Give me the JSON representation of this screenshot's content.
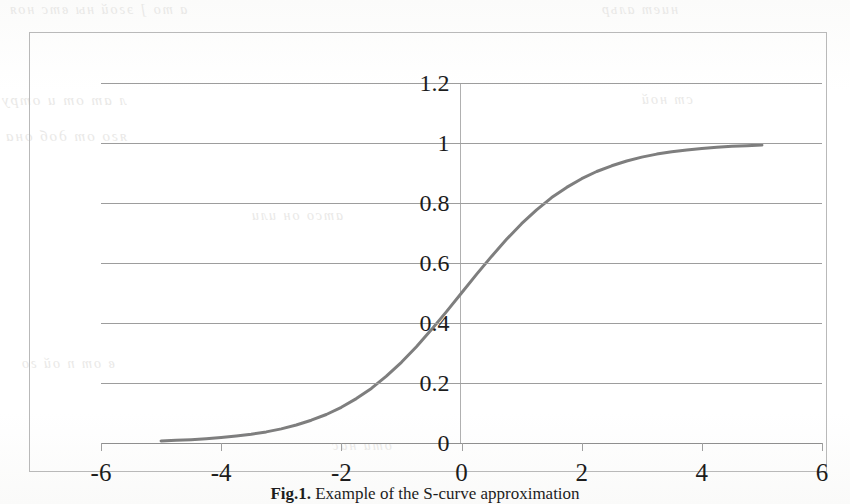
{
  "page": {
    "background_color": "#fdfdfc",
    "bleed_through_text": [
      "а то  ]   эгой ны  втс  ноя",
      "л ат от и  отру",
      "яго от  доб  она",
      "атсо  он  или",
      "в от п ой  го",
      "оти  нас",
      "ниет  альр",
      "ст ной"
    ]
  },
  "figure": {
    "caption_prefix": "Fig.1.",
    "caption_text": "Example of the S-curve approximation",
    "frame_border_color": "#b9b9b9"
  },
  "chart_data": {
    "type": "line",
    "title": "",
    "xlabel": "",
    "ylabel": "",
    "xlim": [
      -6,
      6
    ],
    "ylim": [
      0,
      1.2
    ],
    "grid": true,
    "legend": "none",
    "x_ticks": [
      -6,
      -4,
      -2,
      0,
      2,
      4,
      6
    ],
    "x_tick_labels": [
      "-6",
      "-4",
      "-2",
      "0",
      "2",
      "4",
      "6"
    ],
    "y_ticks": [
      0,
      0.2,
      0.4,
      0.6,
      0.8,
      1,
      1.2
    ],
    "y_tick_labels": [
      "0",
      "0.2",
      "0.4",
      "0.6",
      "0.8",
      "1",
      "1.2"
    ],
    "series": [
      {
        "name": "S-curve (logistic)",
        "color": "#7e7e7e",
        "line_width": 3,
        "x": [
          -5,
          -4.75,
          -4.5,
          -4.25,
          -4,
          -3.75,
          -3.5,
          -3.25,
          -3,
          -2.75,
          -2.5,
          -2.25,
          -2,
          -1.75,
          -1.5,
          -1.25,
          -1,
          -0.75,
          -0.5,
          -0.25,
          0,
          0.25,
          0.5,
          0.75,
          1,
          1.25,
          1.5,
          1.75,
          2,
          2.25,
          2.5,
          2.75,
          3,
          3.25,
          3.5,
          3.75,
          4,
          4.25,
          4.5,
          4.75,
          5
        ],
        "y": [
          0.007,
          0.009,
          0.011,
          0.014,
          0.018,
          0.023,
          0.029,
          0.037,
          0.047,
          0.06,
          0.076,
          0.095,
          0.119,
          0.148,
          0.182,
          0.223,
          0.269,
          0.321,
          0.378,
          0.438,
          0.5,
          0.562,
          0.622,
          0.679,
          0.731,
          0.777,
          0.818,
          0.852,
          0.881,
          0.905,
          0.924,
          0.94,
          0.953,
          0.963,
          0.971,
          0.977,
          0.982,
          0.986,
          0.989,
          0.991,
          0.993
        ]
      }
    ]
  }
}
